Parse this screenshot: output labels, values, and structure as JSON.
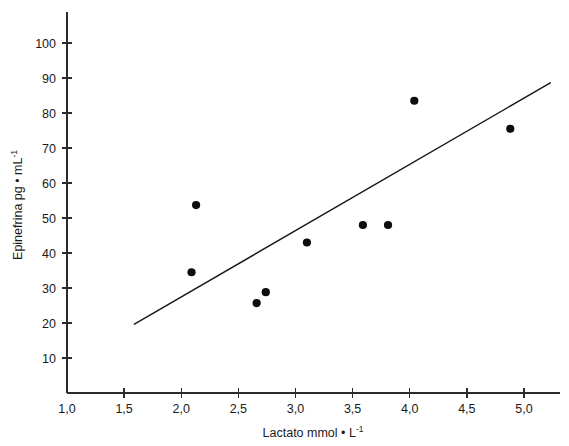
{
  "chart_data": {
    "type": "scatter",
    "title": "",
    "xlabel": "Lactato mmol • L-1",
    "xlabel_base": "Lactato mmol • L",
    "xlabel_sup": "-1",
    "ylabel": "Epinefrina pg • mL-1",
    "ylabel_base": "Epinefrina pg • mL",
    "ylabel_sup": "-1",
    "xlim": [
      1.0,
      5.3
    ],
    "ylim": [
      0,
      105
    ],
    "grid": false,
    "legend": "none",
    "decimal_separator": ",",
    "xticks": [
      1.0,
      1.5,
      2.0,
      2.5,
      3.0,
      3.5,
      4.0,
      4.5,
      5.0
    ],
    "xticklabels": [
      "1,0",
      "1,5",
      "2,0",
      "2,5",
      "3,0",
      "3,5",
      "4,0",
      "4,5",
      "5,0"
    ],
    "yticks": [
      10,
      20,
      30,
      40,
      50,
      60,
      70,
      80,
      90,
      100
    ],
    "yticklabels": [
      "10",
      "20",
      "30",
      "40",
      "50",
      "60",
      "70",
      "80",
      "90",
      "100"
    ],
    "points": [
      {
        "x": 2.13,
        "y": 53.7
      },
      {
        "x": 2.09,
        "y": 34.5
      },
      {
        "x": 2.66,
        "y": 25.7
      },
      {
        "x": 2.74,
        "y": 28.8
      },
      {
        "x": 3.1,
        "y": 43.0
      },
      {
        "x": 3.59,
        "y": 48.0
      },
      {
        "x": 3.81,
        "y": 48.0
      },
      {
        "x": 4.04,
        "y": 83.5
      },
      {
        "x": 4.88,
        "y": 75.5
      }
    ],
    "trendline": {
      "x0": 1.59,
      "y0": 19.7,
      "x1": 5.23,
      "y1": 88.6
    },
    "marker_color": "#0d0d0d",
    "line_color": "#1a1a1a",
    "axis_color": "#2b2b2b",
    "background_color": "#ffffff"
  }
}
